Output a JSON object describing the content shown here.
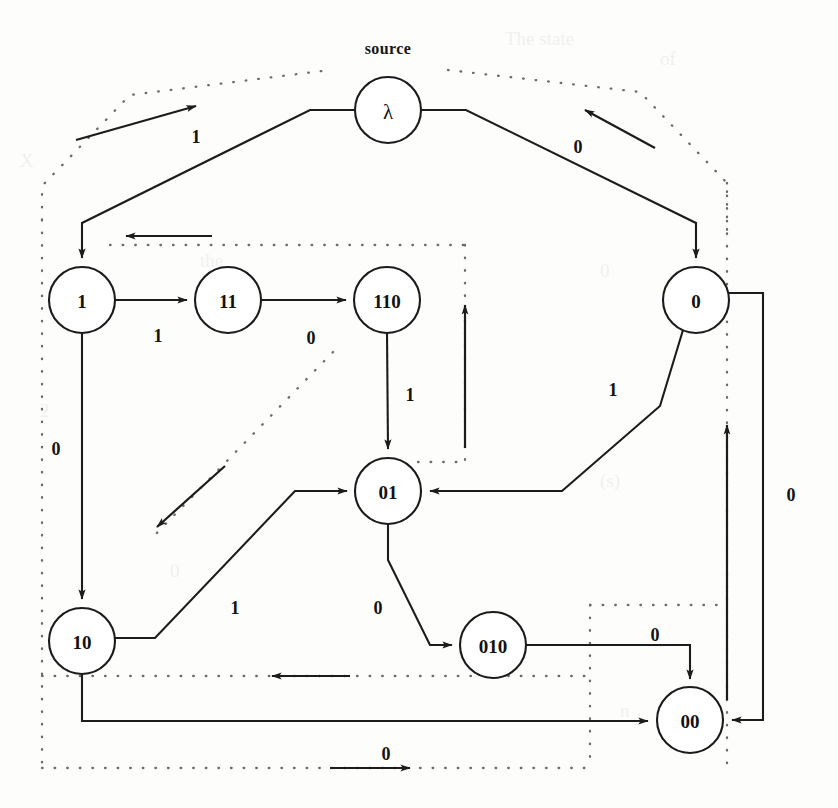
{
  "figure": {
    "kind": "state-transition-graph",
    "source_label": "source",
    "background_color": "#fdfdfc",
    "node_stroke_color": "#1b1b1b",
    "edge_color": "#1c1c1c",
    "dotted_color": "#6b6b6b"
  },
  "nodes": [
    {
      "id": "lambda",
      "label": "λ",
      "cx": 388,
      "cy": 110,
      "r": 33
    },
    {
      "id": "n1",
      "label": "1",
      "cx": 82,
      "cy": 300,
      "r": 33
    },
    {
      "id": "n11",
      "label": "11",
      "cx": 228,
      "cy": 300,
      "r": 33
    },
    {
      "id": "n110",
      "label": "110",
      "cx": 387,
      "cy": 300,
      "r": 33
    },
    {
      "id": "n0",
      "label": "0",
      "cx": 696,
      "cy": 300,
      "r": 33
    },
    {
      "id": "n01",
      "label": "01",
      "cx": 388,
      "cy": 491,
      "r": 33
    },
    {
      "id": "n10",
      "label": "10",
      "cx": 82,
      "cy": 641,
      "r": 33
    },
    {
      "id": "n010",
      "label": "010",
      "cx": 493,
      "cy": 645,
      "r": 33
    },
    {
      "id": "n00",
      "label": "00",
      "cx": 690,
      "cy": 720,
      "r": 33
    }
  ],
  "edges": [
    {
      "from": "lambda",
      "to": "n1",
      "label": "1",
      "label_x": 196,
      "label_y": 137
    },
    {
      "from": "lambda",
      "to": "n0",
      "label": "0",
      "label_x": 578,
      "label_y": 147
    },
    {
      "from": "n1",
      "to": "n11",
      "label": "1",
      "label_x": 158,
      "label_y": 336
    },
    {
      "from": "n11",
      "to": "n110",
      "label": "0",
      "label_x": 311,
      "label_y": 338
    },
    {
      "from": "n1",
      "to": "n10",
      "label": "0",
      "label_x": 56,
      "label_y": 449
    },
    {
      "from": "n110",
      "to": "n01",
      "label": "1",
      "label_x": 410,
      "label_y": 395
    },
    {
      "from": "n0",
      "to": "n01",
      "label": "1",
      "label_x": 613,
      "label_y": 390
    },
    {
      "from": "n0",
      "to": "n00",
      "label": "0",
      "label_x": 791,
      "label_y": 495
    },
    {
      "from": "n10",
      "to": "n01",
      "label": "1",
      "label_x": 235,
      "label_y": 608
    },
    {
      "from": "n01",
      "to": "n010",
      "label": "0",
      "label_x": 378,
      "label_y": 608
    },
    {
      "from": "n010",
      "to": "n00",
      "label": "0",
      "label_x": 655,
      "label_y": 635
    },
    {
      "from": "n10",
      "to": "n00",
      "label": "0",
      "label_x": 386,
      "label_y": 754
    }
  ],
  "annotations": [
    {
      "id": "annot-up-right-top-left",
      "label": ""
    },
    {
      "id": "annot-up-left-top-right",
      "label": ""
    },
    {
      "id": "annot-left-upper",
      "label": ""
    },
    {
      "id": "annot-down-left-mid",
      "label": ""
    },
    {
      "id": "annot-up-center",
      "label": ""
    },
    {
      "id": "annot-up-right-side",
      "label": ""
    },
    {
      "id": "annot-left-lower",
      "label": ""
    },
    {
      "id": "annot-right-bottom",
      "label": ""
    }
  ]
}
